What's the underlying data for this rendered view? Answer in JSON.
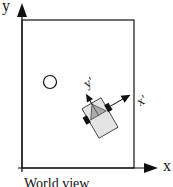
{
  "diagram": {
    "axes": {
      "x_label": "x",
      "y_label": "y"
    },
    "robot_frame": {
      "x_label": "x'",
      "y_label": "y'"
    },
    "caption": "World view",
    "colors": {
      "stroke": "#111111",
      "robot_body": "#e4e4e4",
      "robot_cab": "#aaaaaa",
      "wheel": "#111111"
    }
  }
}
